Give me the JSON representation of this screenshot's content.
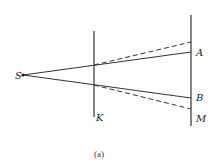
{
  "diagram": {
    "type": "optics-shadow-geometry",
    "labels": {
      "source": "S",
      "barrier": "K",
      "point_a": "A",
      "point_b": "B",
      "screen": "M",
      "caption": "(a)"
    },
    "colors": {
      "line": "#333333",
      "background": "#ffffff"
    },
    "geometry": {
      "source_point": [
        23,
        75
      ],
      "barrier_x": 94,
      "barrier_y_range": [
        31,
        117
      ],
      "screen_x": 191,
      "screen_y_range": [
        15,
        126
      ],
      "solid_ray_upper_end": [
        191,
        52
      ],
      "solid_ray_lower_end": [
        191,
        98
      ],
      "dashed_ray_upper": [
        [
          94,
          65
        ],
        [
          191,
          42
        ]
      ],
      "dashed_ray_lower": [
        [
          94,
          85
        ],
        [
          191,
          109
        ]
      ]
    }
  }
}
